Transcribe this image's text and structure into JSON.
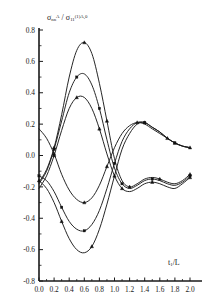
{
  "figure": {
    "background": "#ffffff",
    "ink": "#1a1a1a"
  },
  "chart_data": {
    "type": "line",
    "title": "",
    "subtitle": "",
    "xlabel": "t₁/L",
    "ylabel": "σₙₙ^A / σ₁₁^{(1)A,0}",
    "ylabel_parts": {
      "numerator_base": "σ",
      "numerator_sub": "nn",
      "numerator_sup": "A",
      "slash": "/",
      "denominator_base": "σ",
      "denominator_sub": "11",
      "denominator_sup": "(1)A,0"
    },
    "xlim": [
      0.0,
      2.0
    ],
    "ylim": [
      -0.8,
      0.8
    ],
    "xticks": [
      "0.0",
      "0.2",
      "0.4",
      "0.6",
      "0.8",
      "1.0",
      "1.2",
      "1.4",
      "1.6",
      "1.8",
      "2.0"
    ],
    "xtick_values": [
      0.0,
      0.2,
      0.4,
      0.6,
      0.8,
      1.0,
      1.2,
      1.4,
      1.6,
      1.8,
      2.0
    ],
    "yticks": [
      "0.8",
      "0.6",
      "0.4",
      "0.2",
      "0.0",
      "-0.2",
      "-0.4",
      "-0.6",
      "-0.8"
    ],
    "ytick_values": [
      0.8,
      0.6,
      0.4,
      0.2,
      0.0,
      -0.2,
      -0.4,
      -0.6,
      -0.8
    ],
    "grid": false,
    "legend": "none",
    "line_color": "#1a1a1a",
    "marker_color": "#111111",
    "marker_shape": "triangle",
    "series": [
      {
        "name": "upper-1",
        "marker": "triangle",
        "x": [
          0.0,
          0.1,
          0.2,
          0.3,
          0.4,
          0.5,
          0.6,
          0.7,
          0.8,
          0.9,
          1.0,
          1.1,
          1.2,
          1.3,
          1.4,
          1.5,
          1.6,
          1.7,
          1.8,
          1.9,
          2.0
        ],
        "y": [
          -0.17,
          -0.09,
          0.05,
          0.26,
          0.5,
          0.67,
          0.72,
          0.65,
          0.46,
          0.22,
          -0.02,
          -0.16,
          -0.2,
          -0.18,
          -0.15,
          -0.14,
          -0.15,
          -0.17,
          -0.18,
          -0.16,
          -0.12
        ],
        "markers_at_x": [
          0.2,
          0.6,
          0.9,
          1.2,
          1.6,
          2.0
        ]
      },
      {
        "name": "upper-2",
        "marker": "square",
        "x": [
          0.0,
          0.1,
          0.2,
          0.3,
          0.4,
          0.5,
          0.6,
          0.7,
          0.8,
          0.9,
          1.0,
          1.1,
          1.2,
          1.3,
          1.4,
          1.5,
          1.6,
          1.7,
          1.8,
          1.9,
          2.0
        ],
        "y": [
          -0.18,
          -0.1,
          0.04,
          0.22,
          0.4,
          0.5,
          0.52,
          0.45,
          0.3,
          0.1,
          -0.08,
          -0.18,
          -0.21,
          -0.19,
          -0.16,
          -0.15,
          -0.16,
          -0.18,
          -0.19,
          -0.17,
          -0.13
        ],
        "markers_at_x": [
          0.2,
          0.5,
          0.8,
          1.1,
          1.5,
          2.0
        ]
      },
      {
        "name": "upper-3",
        "marker": "triangle",
        "x": [
          0.0,
          0.1,
          0.2,
          0.3,
          0.4,
          0.5,
          0.6,
          0.7,
          0.8,
          0.9,
          1.0,
          1.1,
          1.2,
          1.3,
          1.4,
          1.5,
          1.6,
          1.7,
          1.8,
          1.9,
          2.0
        ],
        "y": [
          -0.21,
          -0.13,
          0.0,
          0.16,
          0.3,
          0.37,
          0.37,
          0.3,
          0.17,
          0.01,
          -0.13,
          -0.21,
          -0.23,
          -0.21,
          -0.18,
          -0.17,
          -0.18,
          -0.2,
          -0.21,
          -0.18,
          -0.14
        ],
        "markers_at_x": [
          0.2,
          0.5,
          0.8,
          1.1,
          1.5,
          2.0
        ]
      },
      {
        "name": "lower-1",
        "marker": "triangle",
        "x": [
          0.0,
          0.1,
          0.2,
          0.3,
          0.4,
          0.5,
          0.6,
          0.7,
          0.8,
          0.9,
          1.0,
          1.1,
          1.2,
          1.3,
          1.4,
          1.5,
          1.6,
          1.7,
          1.8,
          1.9,
          2.0
        ],
        "y": [
          0.17,
          0.11,
          0.01,
          -0.12,
          -0.22,
          -0.28,
          -0.3,
          -0.27,
          -0.19,
          -0.07,
          0.05,
          0.14,
          0.19,
          0.21,
          0.2,
          0.17,
          0.14,
          0.11,
          0.08,
          0.06,
          0.05
        ],
        "markers_at_x": [
          0.2,
          0.6,
          0.9,
          1.3,
          1.7,
          2.0
        ]
      },
      {
        "name": "lower-2",
        "marker": "square",
        "x": [
          0.0,
          0.1,
          0.2,
          0.3,
          0.4,
          0.5,
          0.6,
          0.7,
          0.8,
          0.9,
          1.0,
          1.1,
          1.2,
          1.3,
          1.4,
          1.5,
          1.6,
          1.7,
          1.8,
          1.9,
          2.0
        ],
        "y": [
          -0.13,
          -0.16,
          -0.23,
          -0.33,
          -0.42,
          -0.47,
          -0.48,
          -0.44,
          -0.35,
          -0.21,
          -0.05,
          0.09,
          0.17,
          0.21,
          0.21,
          0.18,
          0.15,
          0.11,
          0.08,
          0.06,
          0.05
        ],
        "markers_at_x": [
          0.0,
          0.3,
          0.6,
          1.0,
          1.4,
          1.8
        ]
      },
      {
        "name": "lower-3",
        "marker": "triangle",
        "x": [
          0.0,
          0.1,
          0.2,
          0.3,
          0.4,
          0.5,
          0.6,
          0.7,
          0.8,
          0.9,
          1.0,
          1.1,
          1.2,
          1.3,
          1.4,
          1.5,
          1.6,
          1.7,
          1.8,
          1.9,
          2.0
        ],
        "y": [
          -0.16,
          -0.21,
          -0.3,
          -0.42,
          -0.53,
          -0.6,
          -0.62,
          -0.58,
          -0.47,
          -0.31,
          -0.13,
          0.04,
          0.14,
          0.2,
          0.21,
          0.18,
          0.15,
          0.11,
          0.08,
          0.06,
          0.05
        ],
        "markers_at_x": [
          0.0,
          0.3,
          0.7,
          1.0,
          1.4,
          1.8
        ]
      }
    ]
  }
}
